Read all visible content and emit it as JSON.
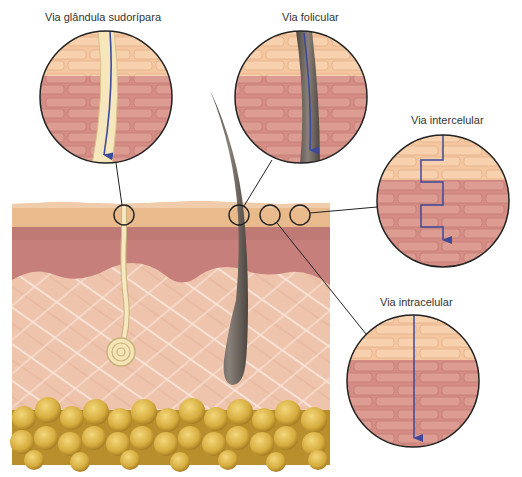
{
  "labels": {
    "sweat_gland": "Via glândula sudorípara",
    "follicular": "Via folicular",
    "intercellular": "Via intercelular",
    "intracellular": "Via intracelular"
  },
  "colors": {
    "stratum_corneum": "#e8b98a",
    "epidermis": "#c98680",
    "dermis": "#efc2aa",
    "fat": "#d9b347",
    "brick_light": "#f6caa0",
    "brick_dark": "#d9938a",
    "arrow": "#3d4a9a",
    "hair": "#6b625a",
    "gland": "#f5e6bc"
  }
}
